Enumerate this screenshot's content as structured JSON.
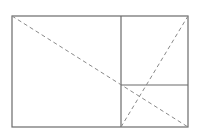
{
  "diagram": {
    "title": "",
    "type": "golden-rectangle-subdivision",
    "colors": {
      "background": "#ffffff",
      "solid_line": "#6b6b6b",
      "dashed_line": "#8a8a8a"
    },
    "outer_rect": {
      "x1": 12,
      "y1": 16,
      "x2": 188,
      "y2": 127
    },
    "solid_lines": [
      {
        "id": "vertical-divider",
        "x1": 121,
        "y1": 16,
        "x2": 121,
        "y2": 127
      },
      {
        "id": "horizontal-divider",
        "x1": 121,
        "y1": 85,
        "x2": 188,
        "y2": 85
      }
    ],
    "dashed_lines": [
      {
        "id": "main-diagonal",
        "x1": 12,
        "y1": 16,
        "x2": 188,
        "y2": 127
      },
      {
        "id": "sub-diagonal",
        "x1": 121,
        "y1": 127,
        "x2": 188,
        "y2": 16
      }
    ]
  }
}
